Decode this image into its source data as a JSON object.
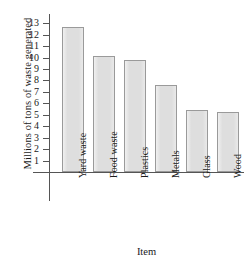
{
  "chart_data": {
    "type": "bar",
    "title": "",
    "xlabel": "Item",
    "ylabel": "Millions of tons of waste generated",
    "categories": [
      "Yard waste",
      "Food waste",
      "Plastics",
      "Metals",
      "Glass",
      "Wood"
    ],
    "values": [
      12.7,
      10.1,
      9.8,
      7.6,
      5.4,
      5.2
    ],
    "ylim": [
      0,
      13.8
    ],
    "yticks": [
      1,
      2,
      3,
      4,
      5,
      6,
      7,
      8,
      9,
      10,
      11,
      12,
      13
    ],
    "ytick_labels": [
      "1",
      "2",
      "3",
      "4",
      "5",
      "6",
      "7",
      "8",
      "9",
      "10",
      "11",
      "12",
      "13"
    ],
    "grid": false,
    "legend": null,
    "bar_fill_color": "#dedede",
    "bar_border_color": "#9a9a9a",
    "axis_color": "#555555"
  }
}
